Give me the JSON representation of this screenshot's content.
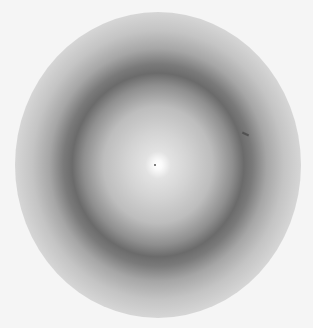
{
  "image": {
    "description": "Circular X-ray diffraction pattern with bright center and dark diffuse ring",
    "colors": {
      "background": "#f5f5f5",
      "center": "#ffffff",
      "ring": "#6b6b6b",
      "outer": "#d6d6d6"
    }
  }
}
